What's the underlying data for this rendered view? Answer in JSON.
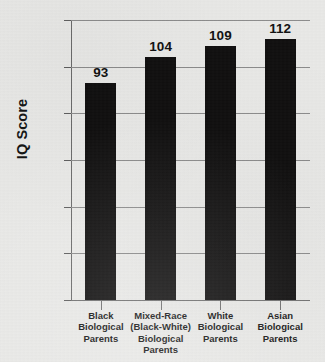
{
  "chart_data": {
    "type": "bar",
    "title": "",
    "xlabel": "",
    "ylabel": "IQ Score",
    "categories": [
      "Black Biological Parents",
      "Mixed-Race (Black-White) Biological Parents",
      "White Biological Parents",
      "Asian Biological Parents"
    ],
    "category_lines": [
      [
        "Black",
        "Biological",
        "Parents"
      ],
      [
        "Mixed-Race",
        "(Black-White)",
        "Biological Parents"
      ],
      [
        "White",
        "Biological",
        "Parents"
      ],
      [
        "Asian",
        "Biological",
        "Parents"
      ]
    ],
    "values": [
      93,
      104,
      109,
      112
    ],
    "value_labels": [
      "93",
      "104",
      "109",
      "112"
    ],
    "ylim": [
      0,
      120
    ],
    "ytick_values": [
      0,
      20,
      40,
      60,
      80,
      100,
      120
    ],
    "ytick_labels": [
      "0",
      "20",
      "40",
      "60",
      "80",
      "100",
      "120"
    ],
    "grid": true,
    "legend": "none",
    "bar_color": "#100f0f",
    "background_color": "#e9e9e7",
    "axis_color": "#6e6e6e",
    "grid_color": "#8c8c8c",
    "text_color": "#121212"
  }
}
